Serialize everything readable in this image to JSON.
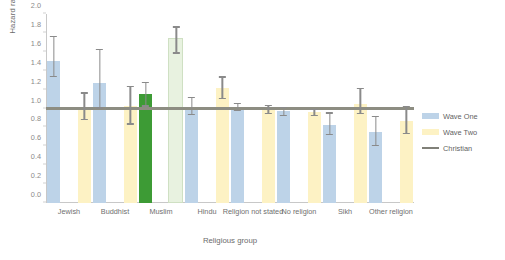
{
  "chart_data": {
    "type": "bar",
    "title": "",
    "xlabel": "Religious group",
    "ylabel": "Hazard ratio",
    "ylim": [
      0.0,
      2.0
    ],
    "ytick_labels": [
      "0.0",
      "0.2",
      "0.4",
      "0.6",
      "0.8",
      "1.0",
      "1.2",
      "1.4",
      "1.6",
      "1.8",
      "2.0"
    ],
    "ytick_values": [
      0.0,
      0.2,
      0.4,
      0.6,
      0.8,
      1.0,
      1.2,
      1.4,
      1.6,
      1.8,
      2.0
    ],
    "grid": false,
    "legend_position": "right",
    "categories": [
      "Jewish",
      "Buddhist",
      "Muslim",
      "Hindu",
      "Religion not stated",
      "No religion",
      "Sikh",
      "Other religion"
    ],
    "series": [
      {
        "name": "Wave One",
        "color": "#bdd3e8",
        "values": [
          1.5,
          1.27,
          1.15,
          1.02,
          1.01,
          0.97,
          0.83,
          0.75
        ],
        "ci_low": [
          1.33,
          1.0,
          1.02,
          0.93,
          0.97,
          0.92,
          0.72,
          0.6
        ],
        "ci_high": [
          1.77,
          1.63,
          1.28,
          1.12,
          1.06,
          1.02,
          0.96,
          0.92
        ],
        "highlight_index": 2,
        "highlight_color": "#3d9b35"
      },
      {
        "name": "Wave Two",
        "color": "#fdf2c4",
        "values": [
          1.0,
          1.03,
          1.72,
          1.22,
          0.99,
          0.96,
          1.05,
          0.87
        ],
        "ci_low": [
          0.88,
          0.83,
          1.58,
          1.1,
          0.94,
          0.92,
          0.94,
          0.73
        ],
        "ci_high": [
          1.17,
          1.24,
          1.87,
          1.34,
          1.04,
          1.0,
          1.22,
          1.03
        ],
        "highlight_index": 2,
        "highlight_color": "#e8f2e0"
      }
    ],
    "reference_line": {
      "name": "Christian",
      "value": 1.0,
      "color": "#8d8d82"
    }
  },
  "legend": {
    "items": [
      {
        "label": "Wave One",
        "color": "#bdd3e8",
        "kind": "swatch"
      },
      {
        "label": "Wave Two",
        "color": "#fdf2c4",
        "kind": "swatch"
      },
      {
        "label": "Christian",
        "color": "#808078",
        "kind": "line"
      }
    ]
  }
}
